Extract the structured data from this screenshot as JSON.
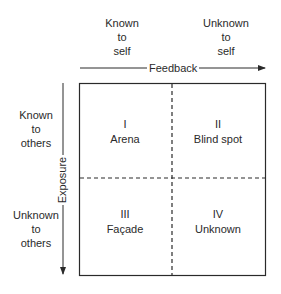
{
  "diagram": {
    "type": "Johari window",
    "columns": [
      {
        "label_lines": [
          "Known",
          "to",
          "self"
        ]
      },
      {
        "label_lines": [
          "Unknown",
          "to",
          "self"
        ]
      }
    ],
    "rows": [
      {
        "label_lines": [
          "Known",
          "to",
          "others"
        ]
      },
      {
        "label_lines": [
          "Unknown",
          "to",
          "others"
        ]
      }
    ],
    "horizontal_axis": {
      "label": "Feedback",
      "direction": "right"
    },
    "vertical_axis": {
      "label": "Exposure",
      "direction": "down"
    },
    "quadrants": [
      {
        "numeral": "I",
        "name": "Arena"
      },
      {
        "numeral": "II",
        "name": "Blind spot"
      },
      {
        "numeral": "III",
        "name": "Façade"
      },
      {
        "numeral": "IV",
        "name": "Unknown"
      }
    ],
    "colors": {
      "line": "#2a2a2a",
      "background": "#ffffff"
    }
  }
}
